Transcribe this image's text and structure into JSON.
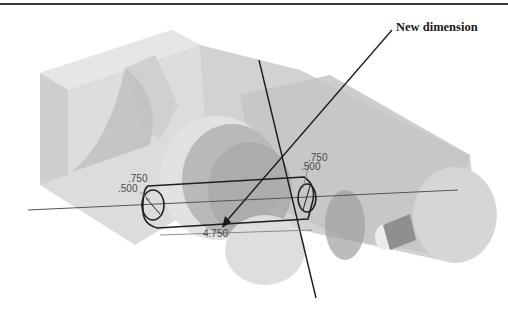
{
  "figure": {
    "callout_label": "New dimension",
    "colors": {
      "background": "#ffffff",
      "part_light": "#d9d9d9",
      "part_mid": "#c4c4c4",
      "part_dark": "#a8a8a8",
      "sketch_line": "#1e1e1e",
      "dimension_text": "#4a4a4a"
    }
  },
  "dimensions": {
    "left_outer_dia": ".750",
    "left_inner_dia": ".500",
    "right_outer_dia": ".750",
    "right_inner_dia": ".500",
    "slot_length": "4.750"
  }
}
